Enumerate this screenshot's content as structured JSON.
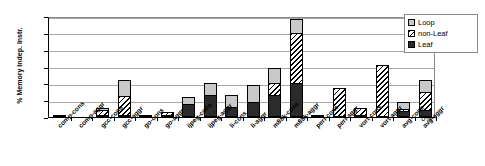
{
  "chart_data": {
    "type": "bar",
    "title": "",
    "subtitle": "",
    "xlabel": "",
    "ylabel": "% Memory Indep. Instr.",
    "ylim": [
      0,
      60
    ],
    "ytick_labels": [
      "0%",
      "10%",
      "20%",
      "30%",
      "40%",
      "50%",
      "60%"
    ],
    "ytick_values": [
      0,
      10,
      20,
      30,
      40,
      50,
      60
    ],
    "grid": true,
    "stacked": true,
    "legend_position": "top-right",
    "legend": [
      "Loop",
      "non-Leaf",
      "Leaf"
    ],
    "categories": [
      "comp-cons",
      "comp-aggr",
      "gcc-cons",
      "gcc-aggr",
      "go-cons",
      "go-aggr",
      "ijpeg-cons",
      "ijpeg-aggr",
      "li-cons",
      "li-aggr",
      "m88k-cons",
      "m88k-aggr",
      "perl-cons",
      "perl-aggr",
      "vort-cons",
      "vort-aggr",
      "avg-cons",
      "avg-aggr"
    ],
    "series": [
      {
        "name": "Leaf",
        "color": "#2b2b2b",
        "pattern": "solid-dark",
        "values": [
          0.6,
          0.0,
          1.0,
          1.0,
          1.2,
          0.4,
          8.0,
          13.0,
          6.0,
          9.0,
          13.0,
          20.0,
          0.3,
          0.0,
          0.4,
          0.0,
          3.5,
          4.0
        ]
      },
      {
        "name": "non-Leaf",
        "color": "#ffffff",
        "pattern": "diagonal-hatch",
        "values": [
          0.0,
          0.0,
          3.0,
          11.0,
          0.0,
          2.0,
          0.0,
          0.0,
          0.0,
          0.0,
          7.0,
          30.0,
          0.0,
          17.0,
          4.0,
          31.0,
          1.5,
          11.0
        ]
      },
      {
        "name": "Loop",
        "color": "#c9c9c9",
        "pattern": "solid-light",
        "values": [
          0.0,
          0.0,
          1.0,
          10.0,
          0.0,
          0.0,
          4.0,
          7.0,
          7.0,
          10.0,
          9.0,
          8.0,
          0.0,
          0.0,
          0.0,
          0.0,
          4.0,
          7.0
        ]
      }
    ],
    "totals": [
      0.6,
      0.0,
      5.0,
      22.0,
      1.2,
      2.4,
      12.0,
      20.0,
      13.0,
      19.0,
      29.0,
      58.0,
      0.3,
      17.0,
      4.4,
      31.0,
      9.0,
      22.0
    ]
  },
  "legend": {
    "items": [
      {
        "label": "Loop",
        "swatch": "loop-swatch"
      },
      {
        "label": "non-Leaf",
        "swatch": "non-leaf-swatch"
      },
      {
        "label": "Leaf",
        "swatch": "leaf-swatch"
      }
    ]
  }
}
